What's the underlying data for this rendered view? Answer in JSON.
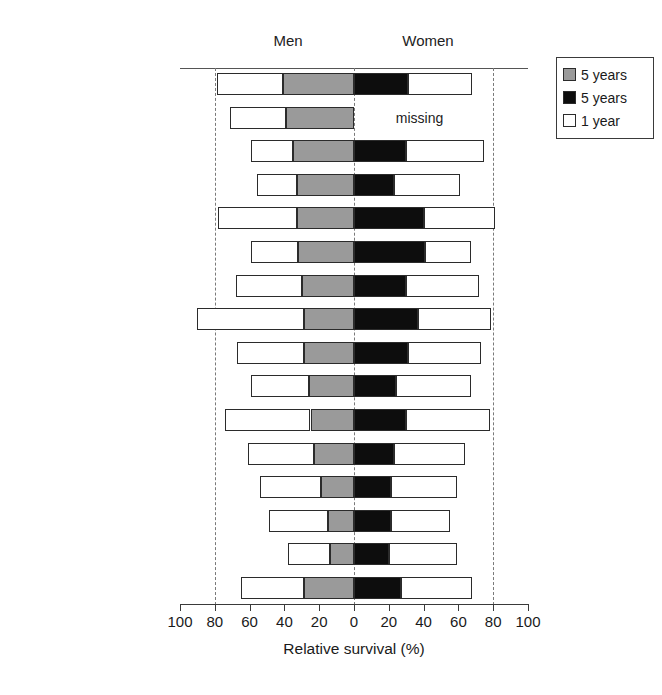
{
  "headers": {
    "men": "Men",
    "women": "Women"
  },
  "axis": {
    "title": "Relative survival (%)",
    "tick_labels": [
      "100",
      "80",
      "60",
      "40",
      "20",
      "0",
      "20",
      "40",
      "60",
      "80",
      "100"
    ],
    "tick_values": [
      -100,
      -80,
      -60,
      -40,
      -20,
      0,
      20,
      40,
      60,
      80,
      100
    ],
    "gridline_values": [
      -80,
      0,
      80
    ],
    "missing_label": "missing"
  },
  "legend": {
    "items": [
      {
        "label": "5 years",
        "swatch": "gray-swatch",
        "color": "#9a9a9a"
      },
      {
        "label": "5 years",
        "swatch": "black-swatch",
        "color": "#0d0d0d"
      },
      {
        "label": "1 year",
        "swatch": "white-swatch",
        "color": "#ffffff"
      }
    ]
  },
  "chart_data": {
    "type": "bar",
    "title": "",
    "xlabel": "Relative survival (%)",
    "ylabel": "",
    "xlim": [
      -100,
      100
    ],
    "grid": true,
    "legend_position": "top-right",
    "orientation": "horizontal-diverging",
    "categories": [
      "Spain",
      "Iceland",
      "Austria",
      "Germany",
      "Sweden",
      "Slovakia",
      "Italy",
      "Switzerland",
      "Finland",
      "Slovenia",
      "The Netherlands",
      "Denmark",
      "England",
      "Scotland",
      "Estonia",
      "Europe"
    ],
    "series": [
      {
        "name": "Men 1 year",
        "side": "left",
        "color": "#ffffff",
        "values": [
          79,
          71,
          59,
          56,
          78,
          59,
          68,
          90,
          67,
          59,
          74,
          61,
          54,
          49,
          38,
          65
        ]
      },
      {
        "name": "Men 5 years",
        "side": "left",
        "color": "#9a9a9a",
        "values": [
          41,
          39,
          35,
          33,
          33,
          32,
          30,
          29,
          29,
          26,
          25,
          23,
          19,
          15,
          14,
          29
        ]
      },
      {
        "name": "Women 5 years",
        "side": "right",
        "color": "#0d0d0d",
        "values": [
          31,
          null,
          30,
          23,
          40,
          41,
          30,
          37,
          31,
          24,
          30,
          23,
          21,
          21,
          20,
          27
        ]
      },
      {
        "name": "Women 1 year",
        "side": "right",
        "color": "#ffffff",
        "values": [
          68,
          null,
          75,
          61,
          81,
          67,
          72,
          79,
          73,
          67,
          78,
          64,
          59,
          55,
          59,
          68
        ]
      }
    ],
    "rows": [
      {
        "country": "Spain",
        "men_1yr": 79,
        "men_5yr": 41,
        "women_5yr": 31,
        "women_1yr": 68,
        "women_missing": false
      },
      {
        "country": "Iceland",
        "men_1yr": 71,
        "men_5yr": 39,
        "women_5yr": null,
        "women_1yr": null,
        "women_missing": true
      },
      {
        "country": "Austria",
        "men_1yr": 59,
        "men_5yr": 35,
        "women_5yr": 30,
        "women_1yr": 75,
        "women_missing": false
      },
      {
        "country": "Germany",
        "men_1yr": 56,
        "men_5yr": 33,
        "women_5yr": 23,
        "women_1yr": 61,
        "women_missing": false
      },
      {
        "country": "Sweden",
        "men_1yr": 78,
        "men_5yr": 33,
        "women_5yr": 40,
        "women_1yr": 81,
        "women_missing": false
      },
      {
        "country": "Slovakia",
        "men_1yr": 59,
        "men_5yr": 32,
        "women_5yr": 41,
        "women_1yr": 67,
        "women_missing": false
      },
      {
        "country": "Italy",
        "men_1yr": 68,
        "men_5yr": 30,
        "women_5yr": 30,
        "women_1yr": 72,
        "women_missing": false
      },
      {
        "country": "Switzerland",
        "men_1yr": 90,
        "men_5yr": 29,
        "women_5yr": 37,
        "women_1yr": 79,
        "women_missing": false
      },
      {
        "country": "Finland",
        "men_1yr": 67,
        "men_5yr": 29,
        "women_5yr": 31,
        "women_1yr": 73,
        "women_missing": false
      },
      {
        "country": "Slovenia",
        "men_1yr": 59,
        "men_5yr": 26,
        "women_5yr": 24,
        "women_1yr": 67,
        "women_missing": false
      },
      {
        "country": "The Netherlands",
        "men_1yr": 74,
        "men_5yr": 25,
        "women_5yr": 30,
        "women_1yr": 78,
        "women_missing": false
      },
      {
        "country": "Denmark",
        "men_1yr": 61,
        "men_5yr": 23,
        "women_5yr": 23,
        "women_1yr": 64,
        "women_missing": false
      },
      {
        "country": "England",
        "men_1yr": 54,
        "men_5yr": 19,
        "women_5yr": 21,
        "women_1yr": 59,
        "women_missing": false
      },
      {
        "country": "Scotland",
        "men_1yr": 49,
        "men_5yr": 15,
        "women_5yr": 21,
        "women_1yr": 55,
        "women_missing": false
      },
      {
        "country": "Estonia",
        "men_1yr": 38,
        "men_5yr": 14,
        "women_5yr": 20,
        "women_1yr": 59,
        "women_missing": false
      },
      {
        "country": "Europe",
        "men_1yr": 65,
        "men_5yr": 29,
        "women_5yr": 27,
        "women_1yr": 68,
        "women_missing": false
      }
    ]
  }
}
